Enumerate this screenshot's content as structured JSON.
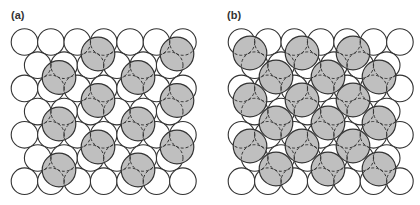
{
  "figure": {
    "panels": [
      {
        "id": "a",
        "label": "(a)",
        "lattice": {
          "origin_x": 24.5,
          "origin_y": 42,
          "spacing": 26.4,
          "row_height": 23.2,
          "rows": 7,
          "even_row_count": 7,
          "odd_row_count": 6,
          "radius": 13.3
        },
        "adsorbates": [
          [
            98,
            54
          ],
          [
            177,
            54
          ],
          [
            59,
            77.5
          ],
          [
            138,
            77.5
          ],
          [
            98,
            100.5
          ],
          [
            177,
            100.5
          ],
          [
            59,
            124
          ],
          [
            138,
            124
          ],
          [
            98,
            147
          ],
          [
            177,
            147
          ],
          [
            59,
            170
          ],
          [
            138,
            170
          ]
        ]
      },
      {
        "id": "b",
        "label": "(b)",
        "lattice": {
          "origin_x": 241.5,
          "origin_y": 42,
          "spacing": 26.4,
          "row_height": 23.2,
          "rows": 7,
          "even_row_count": 7,
          "odd_row_count": 6,
          "radius": 13.3
        },
        "adsorbates": [
          [
            250,
            53
          ],
          [
            302,
            53
          ],
          [
            353,
            53
          ],
          [
            276,
            77
          ],
          [
            328,
            77
          ],
          [
            379,
            77
          ],
          [
            250,
            100
          ],
          [
            302,
            100
          ],
          [
            353,
            100
          ],
          [
            276,
            123
          ],
          [
            328,
            123
          ],
          [
            379,
            123
          ],
          [
            250,
            146
          ],
          [
            302,
            146
          ],
          [
            353,
            146
          ],
          [
            276,
            169
          ],
          [
            328,
            169
          ],
          [
            379,
            169
          ]
        ]
      }
    ],
    "adsorbate_radius": 16.8,
    "colors": {
      "stroke": "#333333",
      "substrate_fill": "#ffffff",
      "adsorbate_fill": "#bfbfbf",
      "hidden_stroke": "#333333"
    },
    "legend_icons": {
      "substrate": "white-circle-icon",
      "adsorbate": "grey-circle-icon"
    }
  }
}
